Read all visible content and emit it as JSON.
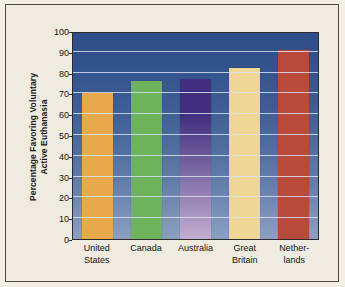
{
  "chart_data": {
    "type": "bar",
    "title": "",
    "subtitle": "",
    "xlabel": "",
    "ylabel": "Percentage Favoring Voluntary Active Euthanasia",
    "ylabel_lines": [
      "Percentage Favoring Voluntary",
      "Active Euthanasia"
    ],
    "categories": [
      "United States",
      "Canada",
      "Australia",
      "Great Britain",
      "Netherlands"
    ],
    "category_lines": [
      [
        "United",
        "States"
      ],
      [
        "Canada"
      ],
      [
        "Australia"
      ],
      [
        "Great",
        "Britain"
      ],
      [
        "Nether-",
        "lands"
      ]
    ],
    "values": [
      70,
      76,
      77,
      82,
      91
    ],
    "ylim": [
      0,
      100
    ],
    "yticks": [
      0,
      10,
      20,
      30,
      40,
      50,
      60,
      70,
      80,
      90,
      100
    ],
    "ytick_labels": [
      "0",
      "10",
      "20",
      "30",
      "40",
      "50",
      "60",
      "70",
      "80",
      "90",
      "100"
    ],
    "grid": true,
    "legend": false,
    "legend_position": "none",
    "bar_colors": [
      "#e8a84c",
      "#6fb25c",
      "#3f2f7e",
      "#edd696",
      "#b84a3c"
    ],
    "bar_colors_bottom": [
      "#e8a84c",
      "#6fb25c",
      "#c3aed0",
      "#edd696",
      "#b84a3c"
    ],
    "colors": {
      "page_background": "#efebe0",
      "plot_background_top": "#2f4d86",
      "plot_background_bottom": "#8ba0bf",
      "gridline": "#d7e1ef",
      "frame_border": "#4a4a46",
      "axis_border": "#2b2b2b",
      "text": "#141412"
    }
  }
}
